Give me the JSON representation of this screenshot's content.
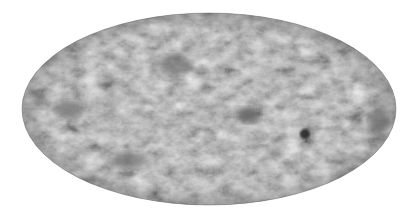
{
  "map": {
    "projection": "mollweide",
    "style": "grayscale all-sky map",
    "ellipse": {
      "cx": 209,
      "cy": 109,
      "rx": 187,
      "ry": 96
    },
    "colors": {
      "background": "#ffffff",
      "base": "#8a8a8a",
      "light": "#a8a8a8",
      "dark": "#5a5a5a",
      "darkest": "#2e2e2e"
    },
    "features": [
      {
        "name": "dark-cold-spot-large",
        "cx": 248,
        "cy": 115,
        "rx": 12,
        "ry": 8,
        "color": "#3a3a3a"
      },
      {
        "name": "dark-cold-spot-small",
        "cx": 305,
        "cy": 134,
        "rx": 5,
        "ry": 5,
        "color": "#2a2a2a"
      },
      {
        "name": "dark-region-right-edge",
        "cx": 378,
        "cy": 120,
        "rx": 10,
        "ry": 12,
        "color": "#5a5a5a"
      },
      {
        "name": "dark-region-left",
        "cx": 70,
        "cy": 110,
        "rx": 14,
        "ry": 10,
        "color": "#626262"
      },
      {
        "name": "dark-region-upper-center",
        "cx": 175,
        "cy": 65,
        "rx": 16,
        "ry": 10,
        "color": "#666666"
      },
      {
        "name": "dark-region-lower-left",
        "cx": 130,
        "cy": 160,
        "rx": 18,
        "ry": 8,
        "color": "#666666"
      }
    ]
  }
}
